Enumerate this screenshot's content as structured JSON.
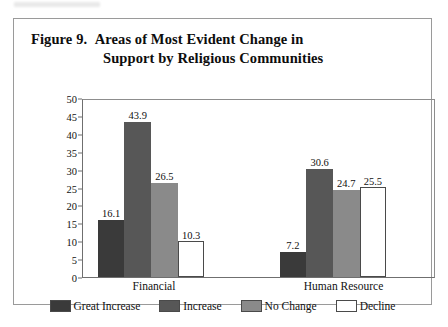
{
  "figure": {
    "title_label": "Figure 9.",
    "title_line1": "Areas of Most Evident Change in",
    "title_line2": "Support by Religious Communities"
  },
  "chart_data": {
    "type": "bar",
    "xlabel": "",
    "ylabel": "",
    "ylim": [
      0,
      50
    ],
    "yticks": [
      0,
      5,
      10,
      15,
      20,
      25,
      30,
      35,
      40,
      45,
      50
    ],
    "ytick_labels": [
      "0",
      "5",
      "10",
      "15",
      "20",
      "25",
      "30",
      "35",
      "40",
      "45",
      "50"
    ],
    "grid": false,
    "legend_position": "bottom",
    "categories": [
      "Financial",
      "Human Resource"
    ],
    "series": [
      {
        "name": "Great Increase",
        "color": "#3a3a3a",
        "values": [
          16.1,
          7.2
        ],
        "labels": [
          "16.1",
          "7.2"
        ]
      },
      {
        "name": "Increase",
        "color": "#575757",
        "values": [
          43.9,
          30.6
        ],
        "labels": [
          "43.9",
          "30.6"
        ]
      },
      {
        "name": "No Change",
        "color": "#8a8a8a",
        "values": [
          26.5,
          24.7
        ],
        "labels": [
          "26.5",
          "24.7"
        ]
      },
      {
        "name": "Decline",
        "color": "#ffffff",
        "values": [
          10.3,
          25.5
        ],
        "labels": [
          "10.3",
          "25.5"
        ]
      }
    ]
  }
}
